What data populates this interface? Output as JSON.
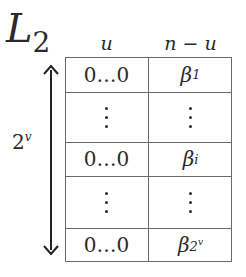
{
  "diagram": {
    "title": {
      "main": "L",
      "subscript": "2"
    },
    "column_headers": [
      {
        "label": "u"
      },
      {
        "label": "n − u"
      }
    ],
    "side_label": {
      "base": "2",
      "exponent": "v"
    },
    "arrow": "double-headed vertical arrow spanning rows",
    "rows": [
      {
        "left": "0…0",
        "right_base": "β",
        "right_sub": "1",
        "right_sub_sup": ""
      },
      {
        "left": "⋮",
        "right": "⋮",
        "type": "vdots"
      },
      {
        "left": "0…0",
        "right_base": "β",
        "right_sub": "i",
        "right_sub_sup": ""
      },
      {
        "left": "⋮",
        "right": "⋮",
        "type": "vdots"
      },
      {
        "left": "0…0",
        "right_base": "β",
        "right_sub": "2",
        "right_sub_sup": "v"
      }
    ],
    "colors": {
      "line": "#6a6a6a",
      "text": "#2a2a2a",
      "background": "#ffffff"
    }
  }
}
